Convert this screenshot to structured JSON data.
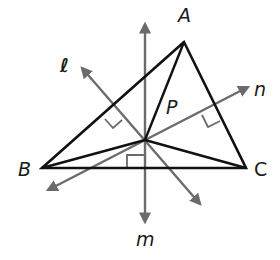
{
  "diagram": {
    "type": "triangle-perpendicular-bisectors",
    "colors": {
      "triangle": "#111111",
      "lines": "#6b6b6b",
      "background": "#ffffff"
    },
    "vertices": {
      "A": {
        "label": "A",
        "x": 184,
        "y": 42
      },
      "B": {
        "label": "B",
        "x": 42,
        "y": 168
      },
      "C": {
        "label": "C",
        "x": 246,
        "y": 168
      }
    },
    "center_point": {
      "label": "P",
      "x": 145,
      "y": 140
    },
    "lines": {
      "l": {
        "label": "ℓ"
      },
      "m": {
        "label": "m"
      },
      "n": {
        "label": "n"
      }
    }
  }
}
